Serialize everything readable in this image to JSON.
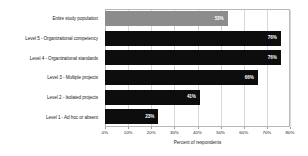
{
  "chart_data": {
    "type": "bar",
    "orientation": "horizontal",
    "title": "",
    "xlabel": "Percent of respondents",
    "ylabel": "",
    "xlim": [
      0,
      80
    ],
    "grid": true,
    "legend": "none",
    "categories": [
      "Entire study population",
      "Level 5 - Organizational competency",
      "Level 4 - Organizational standards",
      "Level 3 - Multiple projects",
      "Level 2 - Isolated projects",
      "Level 1 - Ad hoc or absent"
    ],
    "values": [
      53,
      76,
      76,
      66,
      41,
      23
    ],
    "value_labels": [
      "53%",
      "76%",
      "76%",
      "66%",
      "41%",
      "23%"
    ],
    "bar_colors": [
      "#8c8c8c",
      "#0d0d0d",
      "#0d0d0d",
      "#0d0d0d",
      "#0d0d0d",
      "#0d0d0d"
    ],
    "xticks": [
      0,
      10,
      20,
      30,
      40,
      50,
      60,
      70,
      80
    ],
    "xtick_labels": [
      "0%",
      "10%",
      "20%",
      "30%",
      "40%",
      "50%",
      "60%",
      "70%",
      "80%"
    ]
  }
}
